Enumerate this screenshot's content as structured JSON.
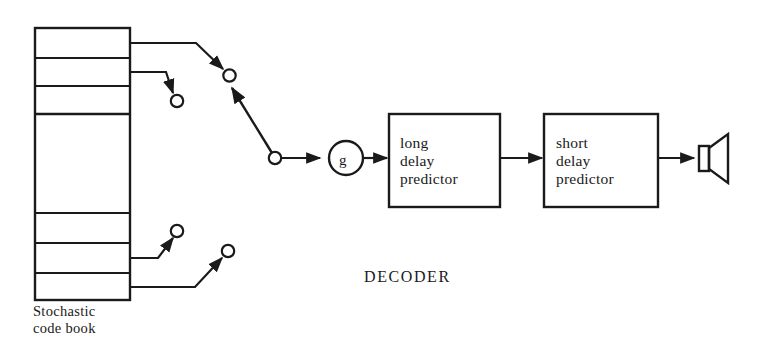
{
  "diagram": {
    "title_label": "DECODER",
    "stroke_color": "#1a1a1a",
    "background_color": "#ffffff",
    "codebook": {
      "caption_line1": "Stochastic",
      "caption_line2": "code book",
      "cell_count": 8
    },
    "gain": {
      "symbol": "g"
    },
    "blocks": [
      {
        "line1": "long",
        "line2": "delay",
        "line3": "predictor"
      },
      {
        "line1": "short",
        "line2": "delay",
        "line3": "predictor"
      }
    ],
    "output": {
      "icon": "loudspeaker-icon"
    },
    "switch": {
      "contact_count": 4,
      "icon": "rotary-switch-icon"
    }
  }
}
